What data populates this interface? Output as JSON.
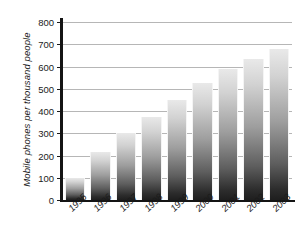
{
  "chart_data": {
    "type": "bar",
    "title": "",
    "xlabel": "",
    "ylabel": "Mobile phones per thousand people",
    "categories": [
      "1995",
      "1996",
      "1997",
      "1998",
      "1999",
      "2000",
      "2001",
      "2002",
      "2003"
    ],
    "values": [
      100,
      215,
      300,
      375,
      450,
      525,
      590,
      635,
      680
    ],
    "ylim": [
      0,
      800
    ],
    "ytick_labels": [
      "0",
      "100",
      "200",
      "300",
      "400",
      "500",
      "600",
      "700",
      "800"
    ],
    "ytick_values": [
      0,
      100,
      200,
      300,
      400,
      500,
      600,
      700,
      800
    ],
    "grid": true,
    "grid_axis": "y",
    "legend": false,
    "bar_fill": "vertical-gradient-light-to-dark-gray",
    "colors": {
      "bar_top": "#e9e9e9",
      "bar_bottom": "#1e1e1e",
      "gridline": "#b6b6b6",
      "axis": "#141414",
      "text": "#1b1b1b",
      "background": "#ffffff"
    }
  }
}
